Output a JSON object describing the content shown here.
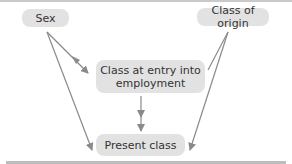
{
  "diagram": {
    "nodes": {
      "sex": "Sex",
      "class_of_origin": "Class of origin",
      "class_at_entry": "Class at entry into employment",
      "present_class": "Present class"
    },
    "edges": [
      {
        "from": "Sex",
        "to": "Class at entry into employment"
      },
      {
        "from": "Sex",
        "to": "Present class"
      },
      {
        "from": "Class of origin",
        "to": "Class at entry into employment"
      },
      {
        "from": "Class of origin",
        "to": "Present class"
      },
      {
        "from": "Class at entry into employment",
        "to": "Present class"
      }
    ],
    "colors": {
      "node_fill": "#e2e2e2",
      "edge": "#8a8a8a",
      "text": "#333333"
    }
  }
}
